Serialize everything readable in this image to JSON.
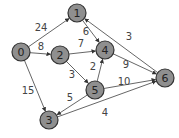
{
  "graph": {
    "type": "directed-weighted",
    "colors": {
      "node_fill": "#8f8f8f",
      "node_stroke": "#333333",
      "edge": "#555555",
      "text": "#444444"
    },
    "node_radius": 9,
    "nodes": [
      {
        "id": "0",
        "x": 21,
        "y": 52
      },
      {
        "id": "1",
        "x": 77,
        "y": 13
      },
      {
        "id": "2",
        "x": 60,
        "y": 55
      },
      {
        "id": "3",
        "x": 49,
        "y": 120
      },
      {
        "id": "4",
        "x": 105,
        "y": 50
      },
      {
        "id": "5",
        "x": 95,
        "y": 90
      },
      {
        "id": "6",
        "x": 165,
        "y": 78
      }
    ],
    "edges": [
      {
        "from": "0",
        "to": "1",
        "weight": "24",
        "lx": 41,
        "ly": 31
      },
      {
        "from": "0",
        "to": "2",
        "weight": "8",
        "lx": 41,
        "ly": 50
      },
      {
        "from": "0",
        "to": "3",
        "weight": "15",
        "lx": 28,
        "ly": 94
      },
      {
        "from": "1",
        "to": "4",
        "weight": "6",
        "lx": 86,
        "ly": 35
      },
      {
        "from": "2",
        "to": "4",
        "weight": "7",
        "lx": 81,
        "ly": 47
      },
      {
        "from": "2",
        "to": "5",
        "weight": "3",
        "lx": 72,
        "ly": 78
      },
      {
        "from": "5",
        "to": "4",
        "weight": "2",
        "lx": 93,
        "ly": 70
      },
      {
        "from": "5",
        "to": "3",
        "weight": "5",
        "lx": 70,
        "ly": 101
      },
      {
        "from": "4",
        "to": "6",
        "weight": "9",
        "lx": 126,
        "ly": 68
      },
      {
        "from": "5",
        "to": "6",
        "weight": "10",
        "lx": 124,
        "ly": 85
      },
      {
        "from": "3",
        "to": "6",
        "weight": "4",
        "lx": 105,
        "ly": 116
      },
      {
        "from": "6",
        "to": "1",
        "weight": "3",
        "lx": 129,
        "ly": 40
      }
    ]
  }
}
